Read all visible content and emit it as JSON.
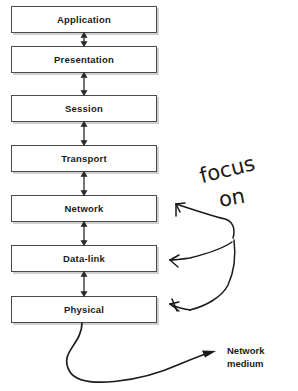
{
  "diagram": {
    "layers": [
      {
        "name": "Application",
        "top": 6
      },
      {
        "name": "Presentation",
        "top": 46
      },
      {
        "name": "Session",
        "top": 95
      },
      {
        "name": "Transport",
        "top": 145
      },
      {
        "name": "Network",
        "top": 195
      },
      {
        "name": "Data-link",
        "top": 245
      },
      {
        "name": "Physical",
        "top": 296
      }
    ],
    "annotation": {
      "line1": "focus",
      "line2": "on",
      "targets": [
        "Network",
        "Data-link",
        "Physical"
      ]
    },
    "network_medium": {
      "line1": "Network",
      "line2": "medium"
    },
    "colors": {
      "box_border": "#4a4a4a",
      "box_fill": "#ffffff",
      "text": "#1b1b1b",
      "connector": "#2b2b2b",
      "ink": "#1a1a1a",
      "shadow": "#aaaaaa",
      "background": "#ffffff"
    }
  }
}
